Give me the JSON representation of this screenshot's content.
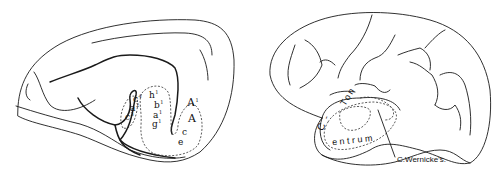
{
  "figure": {
    "left_panel": {
      "description": "medial view of brain hemisphere with labeled auditory regions",
      "labels": {
        "c4": {
          "base": "c",
          "sup": "4"
        },
        "a2": {
          "base": "a",
          "sup": "2"
        },
        "c3": {
          "base": "c",
          "sup": "3"
        },
        "h1": {
          "base": "h",
          "sup": "1"
        },
        "b1": {
          "base": "b",
          "sup": "1"
        },
        "a1": {
          "base": "a",
          "sup": "1"
        },
        "g1": {
          "base": "g",
          "sup": "1"
        },
        "A1": {
          "base": "A",
          "sup": "1"
        },
        "A": {
          "base": "A",
          "sup": ""
        },
        "c": {
          "base": "c",
          "sup": ""
        },
        "e": {
          "base": "e",
          "sup": ""
        }
      }
    },
    "right_panel": {
      "description": "lateral view of brain hemisphere with temporal region outlined",
      "region_label_part1": "Ton",
      "region_dash": "-",
      "region_label_part2_first": "C",
      "region_label_part2_rest": "entrum",
      "callout": "C.Wernicke's."
    },
    "colors": {
      "ink": "#1a1a1a",
      "background": "#ffffff"
    }
  }
}
